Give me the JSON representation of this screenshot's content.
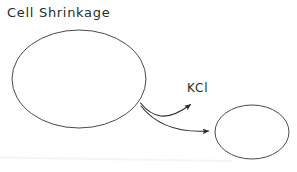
{
  "canvas": {
    "width": 297,
    "height": 172,
    "background": "#ffffff"
  },
  "diagram": {
    "type": "hand-drawn-biology-sketch",
    "title": "Cell Shrinkage",
    "stroke_color": "#4a4a4a",
    "text_color": "#2b2b2b",
    "baseline_color": "#f4f5f7",
    "labels": [
      {
        "name": "title",
        "text": "Cell Shrinkage",
        "x": 7,
        "y": 5,
        "font_size": 13
      },
      {
        "name": "solute",
        "text": "KCl",
        "x": 187,
        "y": 81,
        "font_size": 12
      }
    ],
    "shapes": [
      {
        "name": "large-cell-ellipse",
        "role": "cell before shrinkage",
        "cx": 79,
        "cy": 79,
        "rx": 67,
        "ry": 49,
        "stroke": "#4a4a4a",
        "stroke_width": 1,
        "fill": "none"
      },
      {
        "name": "small-cell-ellipse",
        "role": "cell after shrinkage",
        "cx": 252,
        "cy": 132,
        "rx": 37,
        "ry": 27,
        "stroke": "#4a4a4a",
        "stroke_width": 1,
        "fill": "none"
      }
    ],
    "arrows": [
      {
        "name": "kcl-efflux-arrow",
        "role": "KCl leaving the cell",
        "from": [
          141,
          104
        ],
        "control": [
          170,
          122
        ],
        "to": [
          196,
          100
        ],
        "stroke": "#2b2b2b",
        "stroke_width": 1.1,
        "arrowhead": "solid-triangle"
      },
      {
        "name": "shrinkage-arrow",
        "role": "cell shrinks into smaller cell",
        "from": [
          141,
          106
        ],
        "control": [
          172,
          132
        ],
        "to": [
          214,
          131
        ],
        "stroke": "#2b2b2b",
        "stroke_width": 1.1,
        "arrowhead": "solid-triangle"
      }
    ],
    "baseline": {
      "name": "faint-baseline",
      "x1": 0,
      "y1": 157,
      "x2": 230,
      "y2": 161,
      "stroke": "#f4f5f7",
      "stroke_width": 2
    }
  }
}
